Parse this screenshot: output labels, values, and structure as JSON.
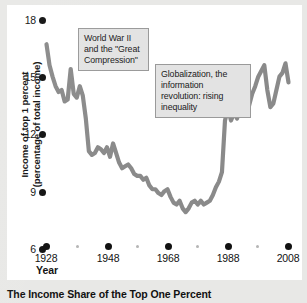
{
  "caption": "The Income Share of the Top One Percent",
  "axes": {
    "xlabel": "Year",
    "ylabel_line1": "Income of top 1 percent",
    "ylabel_line2": "(percentage of total income)"
  },
  "annotations": [
    {
      "id": "wwii",
      "text": "World War II and the \"Great Compression\""
    },
    {
      "id": "globalization",
      "text": "Globalization, the information revolution: rising inequality"
    }
  ],
  "colors": {
    "line": "#8a8a8a",
    "page_background": "#e8e8e6",
    "card_background": "#ffffff",
    "annotation_fill": "#e3e3e3",
    "annotation_border": "#9a9a9a",
    "tick": "#111111",
    "minor_tick": "#b5b5b5"
  },
  "chart_data": {
    "type": "line",
    "title": "The Income Share of the Top One Percent",
    "xlabel": "Year",
    "ylabel": "Income of top 1 percent (percentage of total income)",
    "xlim": [
      1928,
      2008
    ],
    "ylim": [
      6,
      18
    ],
    "xticks": [
      1928,
      1948,
      1968,
      1988,
      2008
    ],
    "xticks_minor": [
      1938,
      1958,
      1978,
      1998
    ],
    "yticks": [
      6,
      9,
      12,
      15,
      18
    ],
    "grid": false,
    "legend": false,
    "series": [
      {
        "name": "Top 1 percent income share",
        "x": [
          1928,
          1929,
          1930,
          1931,
          1932,
          1933,
          1934,
          1935,
          1936,
          1937,
          1938,
          1939,
          1940,
          1941,
          1942,
          1943,
          1944,
          1945,
          1946,
          1947,
          1948,
          1949,
          1950,
          1951,
          1952,
          1953,
          1954,
          1955,
          1956,
          1957,
          1958,
          1959,
          1960,
          1961,
          1962,
          1963,
          1964,
          1965,
          1966,
          1967,
          1968,
          1969,
          1970,
          1971,
          1972,
          1973,
          1974,
          1975,
          1976,
          1977,
          1978,
          1979,
          1980,
          1981,
          1982,
          1983,
          1984,
          1985,
          1986,
          1987,
          1988,
          1989,
          1990,
          1991,
          1992,
          1993,
          1994,
          1995,
          1996,
          1997,
          1998,
          1999,
          2000,
          2001,
          2002,
          2003,
          2004,
          2005,
          2006,
          2007,
          2008
        ],
        "values": [
          16.6,
          15.5,
          14.9,
          14.4,
          14.1,
          14.2,
          13.6,
          13.7,
          15.3,
          14.0,
          13.8,
          14.4,
          13.9,
          12.7,
          11.0,
          10.8,
          10.9,
          11.2,
          11.1,
          10.9,
          11.2,
          10.7,
          11.4,
          10.9,
          10.4,
          10.1,
          10.2,
          10.3,
          10.1,
          9.8,
          9.7,
          9.7,
          9.5,
          9.6,
          9.2,
          9.0,
          9.0,
          8.8,
          8.7,
          8.9,
          9.0,
          8.6,
          8.3,
          8.2,
          8.4,
          8.0,
          7.8,
          8.0,
          8.3,
          8.4,
          8.2,
          8.4,
          8.2,
          8.3,
          8.4,
          8.7,
          9.1,
          9.4,
          9.9,
          12.6,
          13.2,
          12.6,
          13.0,
          12.7,
          13.5,
          13.0,
          12.9,
          13.4,
          14.0,
          14.4,
          14.9,
          15.2,
          15.5,
          14.2,
          13.3,
          13.5,
          14.2,
          14.9,
          15.1,
          15.6,
          14.6
        ]
      }
    ],
    "annotations": [
      {
        "text": "World War II and the \"Great Compression\"",
        "x": 1943,
        "y": 16.5
      },
      {
        "text": "Globalization, the information revolution: rising inequality",
        "x": 1983,
        "y": 14.5
      }
    ]
  }
}
